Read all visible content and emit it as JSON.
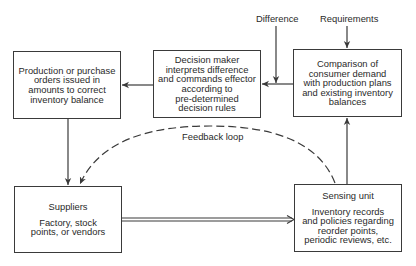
{
  "diagram": {
    "nodes": {
      "production_orders": {
        "lines": [
          "Production or purchase",
          "orders issued in",
          "amounts to correct",
          "inventory balance"
        ]
      },
      "decision_maker": {
        "lines": [
          "Decision maker",
          "interprets difference",
          "and commands effector",
          "according to",
          "pre-determined",
          "decision rules"
        ]
      },
      "comparison": {
        "lines": [
          "Comparison of",
          "consumer demand",
          "with production plans",
          "and existing inventory",
          "balances"
        ]
      },
      "suppliers": {
        "title": "Suppliers",
        "lines": [
          "Factory, stock",
          "points, or vendors"
        ]
      },
      "sensing_unit": {
        "title": "Sensing unit",
        "lines": [
          "Inventory records",
          "and policies regarding",
          "reorder points,",
          "periodic reviews, etc."
        ]
      }
    },
    "labels": {
      "difference": "Difference",
      "requirements": "Requirements",
      "feedback_loop": "Feedback loop"
    },
    "edges": [
      {
        "from": "requirements",
        "to": "comparison",
        "style": "solid"
      },
      {
        "from": "difference",
        "to": "decision_maker",
        "style": "solid"
      },
      {
        "from": "comparison",
        "to": "decision_maker",
        "style": "solid"
      },
      {
        "from": "decision_maker",
        "to": "production_orders",
        "style": "solid"
      },
      {
        "from": "production_orders",
        "to": "suppliers",
        "style": "solid"
      },
      {
        "from": "suppliers",
        "to": "sensing_unit",
        "style": "double"
      },
      {
        "from": "sensing_unit",
        "to": "comparison",
        "style": "solid"
      },
      {
        "from": "sensing_unit",
        "to": "suppliers",
        "style": "dashed",
        "label": "Feedback loop"
      }
    ],
    "colors": {
      "line": "#3a3a3a",
      "text": "#2a2a2a",
      "background": "#ffffff"
    }
  }
}
